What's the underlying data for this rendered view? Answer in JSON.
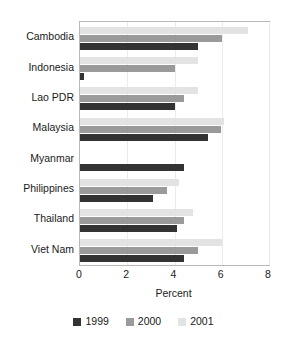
{
  "chart_data": {
    "type": "bar",
    "orientation": "horizontal",
    "title": "",
    "xlabel": "Percent",
    "ylabel": "",
    "xlim": [
      0,
      8
    ],
    "xticks": [
      0,
      2,
      4,
      6,
      8
    ],
    "xtick_labels": [
      "0",
      "2",
      "4",
      "6",
      "8"
    ],
    "grid": true,
    "legend_position": "bottom",
    "categories": [
      "Cambodia",
      "Indonesia",
      "Lao PDR",
      "Malaysia",
      "Myanmar",
      "Philippines",
      "Thailand",
      "Viet Nam"
    ],
    "series": [
      {
        "name": "1999",
        "color": "#333333",
        "values": [
          5.0,
          0.15,
          4.0,
          5.4,
          4.4,
          3.1,
          4.1,
          4.4
        ]
      },
      {
        "name": "2000",
        "color": "#9a9a9a",
        "values": [
          6.0,
          4.0,
          4.4,
          5.95,
          null,
          3.7,
          4.4,
          5.0
        ]
      },
      {
        "name": "2001",
        "color": "#e3e3e3",
        "values": [
          7.1,
          5.0,
          5.0,
          6.1,
          null,
          4.2,
          4.8,
          6.0
        ]
      }
    ]
  },
  "legend": {
    "items": [
      {
        "label": "1999",
        "color": "#333333"
      },
      {
        "label": "2000",
        "color": "#9a9a9a"
      },
      {
        "label": "2001",
        "color": "#e3e3e3"
      }
    ]
  },
  "axis": {
    "x_title": "Percent"
  }
}
